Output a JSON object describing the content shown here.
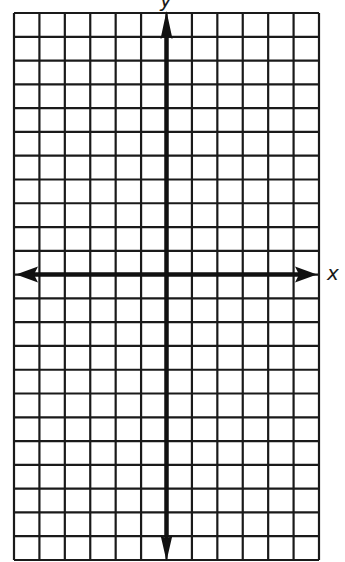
{
  "diagram": {
    "type": "coordinate-grid",
    "axes": {
      "x_label": "x",
      "y_label": "y"
    },
    "grid": {
      "columns": 12,
      "rows": 23,
      "y_axis_column_index": 6,
      "x_axis_row_index": 11
    },
    "colors": {
      "grid_line": "#1a1a1a",
      "axis": "#111111",
      "background": "#ffffff"
    }
  }
}
